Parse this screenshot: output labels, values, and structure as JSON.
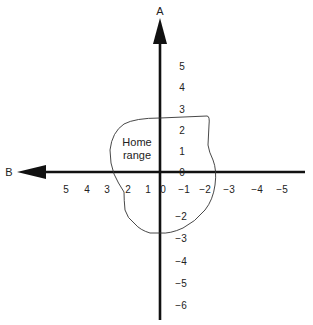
{
  "axes": {
    "vertical": {
      "name": "A",
      "labels_positive": [
        "5",
        "4",
        "3",
        "2",
        "1"
      ],
      "origin_label": "0",
      "labels_negative": [
        "−2",
        "−3",
        "−4",
        "−5",
        "−6"
      ]
    },
    "horizontal": {
      "name": "B",
      "labels_left": [
        "5",
        "4",
        "3",
        "2",
        "1"
      ],
      "origin_label": "0",
      "labels_right": [
        "−1",
        "−2",
        "−3",
        "−4",
        "−5"
      ]
    }
  },
  "region": {
    "line1": "Home",
    "line2": "range"
  },
  "colors": {
    "axis": "#111111",
    "outline": "#333333",
    "text": "#222222"
  }
}
